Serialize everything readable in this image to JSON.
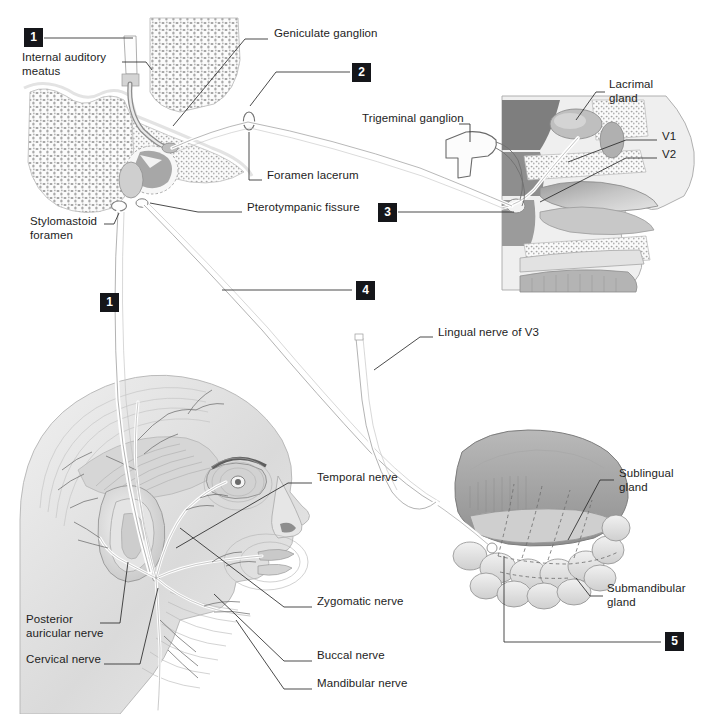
{
  "figure": {
    "caption": "",
    "background_color": "#ffffff",
    "ink_color": "#1d1d1d",
    "badge_color": "#15161a",
    "badge_text_color": "#ffffff"
  },
  "markers": [
    {
      "number": "1",
      "x": 24,
      "y": 28,
      "name": "marker-1-top"
    },
    {
      "number": "2",
      "x": 352,
      "y": 63,
      "name": "marker-2"
    },
    {
      "number": "3",
      "x": 378,
      "y": 205,
      "name": "marker-3"
    },
    {
      "number": "4",
      "x": 356,
      "y": 283,
      "name": "marker-4"
    },
    {
      "number": "1",
      "x": 100,
      "y": 293,
      "name": "marker-1-middle"
    },
    {
      "number": "5",
      "x": 665,
      "y": 627,
      "name": "marker-5"
    }
  ],
  "labels": [
    {
      "id": "geniculate-ganglion",
      "text": "Geniculate ganglion",
      "x": 274,
      "y": 33,
      "align": "left"
    },
    {
      "id": "internal-auditory-meatus",
      "text": "Internal auditory\nmeatus",
      "x": 22,
      "y": 57,
      "align": "left"
    },
    {
      "id": "lacrimal-gland",
      "text": "Lacrimal\ngland",
      "x": 609,
      "y": 84,
      "align": "left"
    },
    {
      "id": "trigeminal-ganglion",
      "text": "Trigeminal ganglion",
      "x": 362,
      "y": 118,
      "align": "left"
    },
    {
      "id": "v1",
      "text": "V1",
      "x": 662,
      "y": 136,
      "align": "left"
    },
    {
      "id": "v2",
      "text": "V2",
      "x": 662,
      "y": 154,
      "align": "left"
    },
    {
      "id": "foramen-lacerum",
      "text": "Foramen lacerum",
      "x": 267,
      "y": 175,
      "align": "left"
    },
    {
      "id": "pterotympanic-fissure",
      "text": "Pterotympanic fissure",
      "x": 247,
      "y": 207,
      "align": "left"
    },
    {
      "id": "stylomastoid-foramen",
      "text": "Stylomastoid\nforamen",
      "x": 30,
      "y": 221,
      "align": "left"
    },
    {
      "id": "lingual-nerve-v3",
      "text": "Lingual nerve of V3",
      "x": 438,
      "y": 332,
      "align": "left"
    },
    {
      "id": "temporal-nerve",
      "text": "Temporal nerve",
      "x": 317,
      "y": 477,
      "align": "left"
    },
    {
      "id": "sublingual-gland",
      "text": "Sublingual\ngland",
      "x": 619,
      "y": 473,
      "align": "left"
    },
    {
      "id": "zygomatic-nerve",
      "text": "Zygomatic nerve",
      "x": 317,
      "y": 601,
      "align": "left"
    },
    {
      "id": "submandibular-gland",
      "text": "Submandibular\ngland",
      "x": 607,
      "y": 588,
      "align": "left"
    },
    {
      "id": "posterior-auricular-nerve",
      "text": "Posterior\nauricular nerve",
      "x": 26,
      "y": 619,
      "align": "left"
    },
    {
      "id": "buccal-nerve",
      "text": "Buccal nerve",
      "x": 317,
      "y": 655,
      "align": "left"
    },
    {
      "id": "cervical-nerve",
      "text": "Cervical nerve",
      "x": 26,
      "y": 659,
      "align": "left"
    },
    {
      "id": "mandibular-nerve",
      "text": "Mandibular nerve",
      "x": 317,
      "y": 683,
      "align": "left"
    }
  ],
  "panels": [
    {
      "id": "temporal-bone-panel",
      "name": "temporal-bone-cross-section",
      "description": "Cross section of temporal bone showing internal auditory meatus, geniculate ganglion, middle ear and stylomastoid foramen"
    },
    {
      "id": "nasal-cavity-panel",
      "name": "sagittal-nasal-cavity",
      "description": "Sagittal section of nasal cavity with lacrimal gland, trigeminal ganglion, V1 and V2 divisions"
    },
    {
      "id": "head-panel",
      "name": "lateral-head-facial-nerve",
      "description": "Lateral view of head showing facial nerve branches: temporal, zygomatic, buccal, mandibular, cervical, posterior auricular"
    },
    {
      "id": "glands-panel",
      "name": "tongue-salivary-glands",
      "description": "Tongue with sublingual and submandibular salivary glands and lingual nerve"
    }
  ],
  "leader_lines": [
    {
      "id": "leader-geniculate",
      "from": [
        268,
        38
      ],
      "to": [
        172,
        120
      ]
    },
    {
      "id": "leader-internal-auditory",
      "from": [
        122,
        64
      ],
      "to": [
        152,
        64
      ]
    },
    {
      "id": "leader-marker-1-top",
      "from": [
        44,
        37
      ],
      "to": [
        133,
        37
      ]
    },
    {
      "id": "leader-marker-2",
      "from": [
        246,
        96
      ],
      "to": [
        350,
        72
      ]
    },
    {
      "id": "leader-foramen-lacerum",
      "from": [
        262,
        180
      ],
      "to": [
        249,
        180
      ]
    },
    {
      "id": "leader-pterotympanic",
      "from": [
        242,
        212
      ],
      "to": [
        140,
        198
      ]
    },
    {
      "id": "leader-stylomastoid",
      "from": [
        104,
        222
      ],
      "to": [
        118,
        213
      ]
    },
    {
      "id": "leader-trigeminal",
      "from": [
        465,
        124
      ],
      "to": [
        468,
        146
      ]
    },
    {
      "id": "leader-lacrimal",
      "from": [
        604,
        92
      ],
      "to": [
        572,
        128
      ]
    },
    {
      "id": "leader-v1",
      "from": [
        657,
        140
      ],
      "to": [
        566,
        165
      ]
    },
    {
      "id": "leader-v2",
      "from": [
        657,
        158
      ],
      "to": [
        545,
        200
      ]
    },
    {
      "id": "leader-marker-3",
      "from": [
        376,
        212
      ],
      "to": [
        512,
        212
      ]
    },
    {
      "id": "leader-marker-4",
      "from": [
        222,
        290
      ],
      "to": [
        352,
        290
      ]
    },
    {
      "id": "leader-lingual",
      "from": [
        432,
        337
      ],
      "to": [
        375,
        370
      ]
    },
    {
      "id": "leader-temporal-nerve",
      "from": [
        312,
        482
      ],
      "to": [
        178,
        545
      ]
    },
    {
      "id": "leader-zygomatic",
      "from": [
        312,
        606
      ],
      "to": [
        180,
        528
      ]
    },
    {
      "id": "leader-buccal",
      "from": [
        312,
        660
      ],
      "to": [
        214,
        592
      ]
    },
    {
      "id": "leader-mandibular",
      "from": [
        312,
        688
      ],
      "to": [
        236,
        618
      ]
    },
    {
      "id": "leader-posterior-auricular",
      "from": [
        108,
        622
      ],
      "to": [
        129,
        562
      ]
    },
    {
      "id": "leader-cervical",
      "from": [
        108,
        663
      ],
      "to": [
        158,
        585
      ]
    },
    {
      "id": "leader-sublingual",
      "from": [
        614,
        480
      ],
      "to": [
        570,
        538
      ]
    },
    {
      "id": "leader-submandibular",
      "from": [
        602,
        595
      ],
      "to": [
        576,
        578
      ]
    },
    {
      "id": "leader-marker-5",
      "from": [
        661,
        640
      ],
      "to": [
        504,
        640
      ]
    }
  ]
}
